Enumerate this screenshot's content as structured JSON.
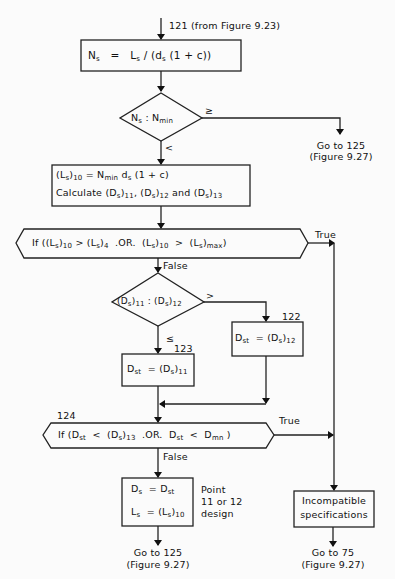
{
  "entry": {
    "label": "121 (from Figure 9.23)"
  },
  "step_ns": {
    "lhs": "N",
    "lhs_sub": "s",
    "eq": "=",
    "rhs": "L",
    "rhs_sub": "s",
    "rhs_rest1": " / (d",
    "rhs_sub2": "s",
    "rhs_rest2": " (1 + c))"
  },
  "decision_ns": {
    "a": "N",
    "a_sub": "s",
    "sep": " : ",
    "b": "N",
    "b_sub": "min",
    "yes_label": "≥",
    "no_label": "<"
  },
  "goto_125_top": {
    "line1": "Go to 125",
    "line2": "(Figure 9.27)"
  },
  "step_ls10": {
    "line1_a": "(L",
    "line1_a_sub": "s",
    "line1_b": ")",
    "line1_b_sub": "10",
    "line1_c": " = N",
    "line1_c_sub": "min",
    "line1_d": " d",
    "line1_d_sub": "s",
    "line1_e": " (1 + c)",
    "line2_a": "Calculate (D",
    "line2_a_sub": "s",
    "line2_b": ")",
    "line2_b_sub": "11",
    "line2_c": ", (D",
    "line2_c_sub": "s",
    "line2_d": ")",
    "line2_d_sub": "12",
    "line2_e": " and (D",
    "line2_e_sub": "s",
    "line2_f": ")",
    "line2_f_sub": "13"
  },
  "if_ls": {
    "p1": "If ((L",
    "p1_sub": "s",
    "p2": ")",
    "p2_sub": "10",
    "p3": " > (L",
    "p3_sub": "s",
    "p4": ")",
    "p4_sub": "4",
    "p5": "  .OR.  (L",
    "p5_sub": "s",
    "p6": ")",
    "p6_sub": "10",
    "p7": "  >  (L",
    "p7_sub": "s",
    "p8": ")",
    "p8_sub": "max",
    "p9": ")",
    "true_label": "True",
    "false_label": "False"
  },
  "decision_ds": {
    "a": "(D",
    "a_sub": "s",
    "a2": ")",
    "a2_sub": "11",
    "sep": " : ",
    "b": "(D",
    "b_sub": "s",
    "b2": ")",
    "b2_sub": "12",
    "gt_label": ">",
    "le_label": "≤"
  },
  "step_122": {
    "num": "122",
    "lhs": "D",
    "lhs_sub": "st",
    "eq": "  = (D",
    "eq_sub": "s",
    "rhs": ")",
    "rhs_sub": "12"
  },
  "step_123": {
    "num": "123",
    "lhs": "D",
    "lhs_sub": "st",
    "eq": "  = (D",
    "eq_sub": "s",
    "rhs": ")",
    "rhs_sub": "11"
  },
  "if_dst": {
    "num": "124",
    "p1": "If (D",
    "p1_sub": "st",
    "p2": "  <  (D",
    "p2_sub": "s",
    "p3": ")",
    "p3_sub": "13",
    "p4": "  .OR.  D",
    "p4_sub": "st",
    "p5": "  <  D",
    "p5_sub": "mn",
    "p6": " )",
    "true_label": "True",
    "false_label": "False"
  },
  "step_final": {
    "l1_a": "D",
    "l1_a_sub": "s",
    "l1_b": "  = D",
    "l1_b_sub": "st",
    "l2_a": "L",
    "l2_a_sub": "s",
    "l2_b": "  = (L",
    "l2_b_sub": "s",
    "l2_c": ")",
    "l2_c_sub": "10",
    "note_line1": "Point",
    "note_line2": "11 or 12",
    "note_line3": "design"
  },
  "goto_125_bottom": {
    "line1": "Go to 125",
    "line2": "(Figure 9.27)"
  },
  "incompatible": {
    "line1": "Incompatible",
    "line2": "specifications"
  },
  "goto_75": {
    "line1": "Go to 75",
    "line2": "(Figure 9.27)"
  }
}
